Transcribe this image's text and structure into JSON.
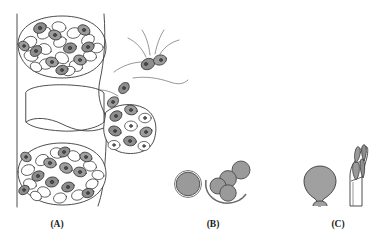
{
  "figure": {
    "caption_style": "bold-serif-parenthesized",
    "background_color": "#ffffff",
    "line_color": "#3a3a3a",
    "panel_count": 3
  },
  "panels": [
    {
      "id": "A",
      "label": "(A)",
      "label_x": 57,
      "label_y": 227,
      "description": "host tissue section with cysts packed with cells and emerging flagellated zoospores",
      "elements": {
        "tissue_border_line": "vertical left boundary",
        "cyst_upper": {
          "cx": 62,
          "cy": 47,
          "rx": 44,
          "ry": 30
        },
        "cyst_lower": {
          "cx": 62,
          "cy": 174,
          "rx": 44,
          "ry": 30
        },
        "empty_chamber": {
          "x": 26,
          "y": 88,
          "w": 78,
          "h": 48
        },
        "cell_cluster_right": {
          "cx": 130,
          "cy": 120
        },
        "flagellate_cell": {
          "cx": 152,
          "cy": 62,
          "flagella_count": 5
        },
        "migrating_cell": {
          "cx": 123,
          "cy": 87
        }
      }
    },
    {
      "id": "B",
      "label": "(B)",
      "label_x": 213,
      "label_y": 227,
      "description": "spherical spores, one large solitary and a cluster of smaller ones with a crescent arc",
      "elements": {
        "large_sphere": {
          "cx": 188,
          "cy": 184,
          "r": 13
        },
        "cluster_spheres": [
          {
            "cx": 219,
            "cy": 186,
            "r": 8
          },
          {
            "cx": 228,
            "cy": 178,
            "r": 8
          },
          {
            "cx": 227,
            "cy": 192,
            "r": 8
          },
          {
            "cx": 241,
            "cy": 170,
            "r": 9
          }
        ],
        "crescent_arc": "open arc below cluster"
      }
    },
    {
      "id": "C",
      "label": "(C)",
      "label_x": 338,
      "label_y": 227,
      "description": "flask-shaped vesicle and elongated sporangium with internal spindle compartments on a stalk",
      "elements": {
        "flask_vesicle": {
          "cx": 320,
          "cy": 183
        },
        "sporangium": {
          "cx": 355,
          "cy": 165,
          "compartments": 4
        }
      }
    }
  ],
  "colors": {
    "outline": "#3a3a3a",
    "cell_fill_dark": "#8e8e8e",
    "cell_fill_mid": "#a8a8a8",
    "cell_fill_light": "#ffffff",
    "nucleus": "#5a5a5a",
    "sphere_fill": "#9a9a9a",
    "background": "#ffffff"
  }
}
